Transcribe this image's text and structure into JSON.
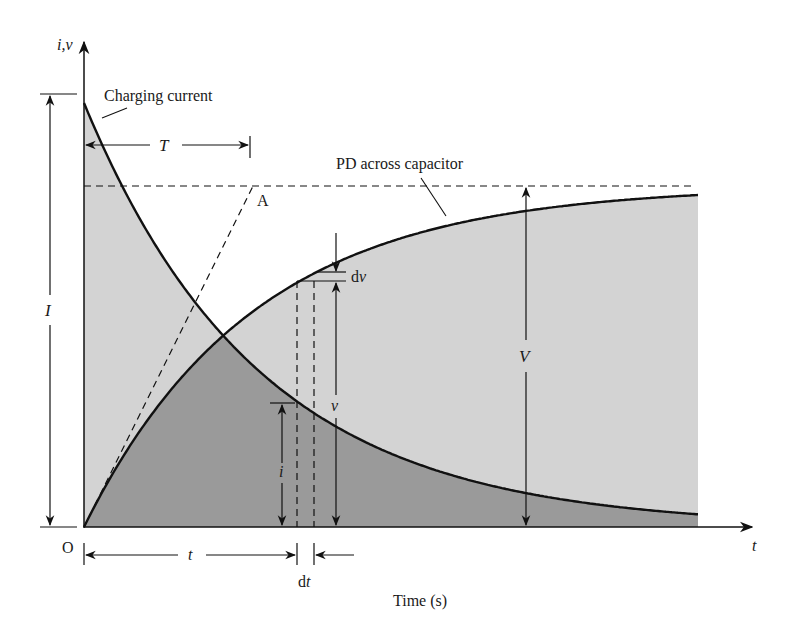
{
  "figure": {
    "axis_y_label": "i,v",
    "axis_x_label": "t",
    "origin_label": "O",
    "x_axis_title": "Time (s)",
    "curve_labels": {
      "current": "Charging current",
      "voltage": "PD across capacitor"
    },
    "dimension_labels": {
      "I": "I",
      "T": "T",
      "A": "A",
      "V": "V",
      "v": "v",
      "i": "i",
      "t": "t",
      "dv": "dv",
      "dt": "dt"
    },
    "colors": {
      "light_fill": "#d3d3d3",
      "dark_fill": "#9a9a9a",
      "line": "#111111",
      "background": "#ffffff"
    }
  },
  "chart_data": {
    "type": "line",
    "xlabel": "Time (s)",
    "ylabel": "i,v",
    "series": [
      {
        "name": "Charging current",
        "shape": "exponential decay",
        "initial": "I",
        "final": 0
      },
      {
        "name": "PD across capacitor",
        "shape": "exponential rise",
        "initial": 0,
        "final": "V"
      }
    ],
    "annotations": [
      "T (time constant)",
      "A (tangent meets V)",
      "dv",
      "dt",
      "v",
      "i",
      "t",
      "I",
      "V"
    ]
  }
}
